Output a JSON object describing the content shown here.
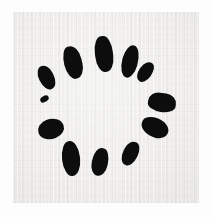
{
  "image": {
    "kind": "scanned-loading-spinner",
    "width": 213,
    "height": 217,
    "background_color": "#fdfdfd",
    "plate_color": "#efeeec",
    "blade_color": "#0d0d0d",
    "alt_text": "Loading spinner",
    "caption": ""
  },
  "spinner": {
    "name": "loading-spinner",
    "blade_count": 12,
    "center_x": 95,
    "center_y": 95,
    "blades": [
      {
        "id": "blade-1",
        "x": 95,
        "y": 36,
        "w": 18,
        "h": 36,
        "rot": -6,
        "rx": 47,
        "label": "blade-12-oclock"
      },
      {
        "id": "blade-2",
        "x": 122,
        "y": 45,
        "w": 16,
        "h": 33,
        "rot": 16,
        "rx": 45,
        "label": "blade-1-oclock"
      },
      {
        "id": "blade-3",
        "x": 139,
        "y": 61,
        "w": 13,
        "h": 22,
        "rot": 36,
        "rx": 42,
        "label": "blade-2-oclock"
      },
      {
        "id": "blade-4",
        "x": 148,
        "y": 93,
        "w": 28,
        "h": 19,
        "rot": 8,
        "rx": 46,
        "label": "blade-3-oclock"
      },
      {
        "id": "blade-5",
        "x": 141,
        "y": 118,
        "w": 28,
        "h": 19,
        "rot": 20,
        "rx": 44,
        "label": "blade-4-oclock"
      },
      {
        "id": "blade-6",
        "x": 123,
        "y": 141,
        "w": 15,
        "h": 25,
        "rot": 26,
        "rx": 42,
        "label": "blade-5-oclock"
      },
      {
        "id": "blade-7",
        "x": 92,
        "y": 148,
        "w": 16,
        "h": 28,
        "rot": 12,
        "rx": 44,
        "label": "blade-6-oclock"
      },
      {
        "id": "blade-8",
        "x": 62,
        "y": 141,
        "w": 18,
        "h": 35,
        "rot": -6,
        "rx": 46,
        "label": "blade-7-oclock"
      },
      {
        "id": "blade-9",
        "x": 38,
        "y": 119,
        "w": 26,
        "h": 20,
        "rot": -22,
        "rx": 44,
        "label": "blade-8-oclock"
      },
      {
        "id": "blade-10",
        "x": 40,
        "y": 96,
        "w": 9,
        "h": 6,
        "rot": -30,
        "rx": 40,
        "label": "blade-9-oclock-faint"
      },
      {
        "id": "blade-11",
        "x": 39,
        "y": 65,
        "w": 15,
        "h": 25,
        "rot": -26,
        "rx": 43,
        "label": "blade-10-oclock"
      },
      {
        "id": "blade-12",
        "x": 64,
        "y": 46,
        "w": 18,
        "h": 33,
        "rot": -14,
        "rx": 45,
        "label": "blade-11-oclock"
      }
    ]
  }
}
